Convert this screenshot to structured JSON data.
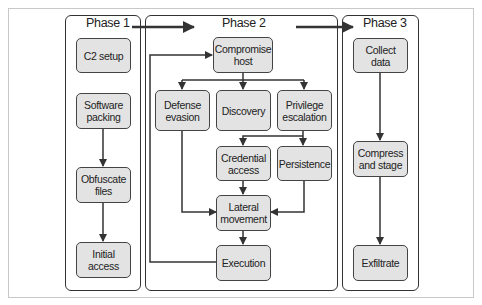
{
  "colors": {
    "node_fill": "#e3e3e3",
    "node_border": "#444444",
    "line": "#333333",
    "frame": "#c8c8c8"
  },
  "phases": [
    {
      "title": "Phase 1",
      "nodes": [
        "C2 setup",
        "Software\npacking",
        "Obfuscate\nfiles",
        "Initial\naccess"
      ]
    },
    {
      "title": "Phase 2",
      "nodes": [
        "Compromise\nhost",
        "Defense\nevasion",
        "Discovery",
        "Privilege\nescalation",
        "Credential\naccess",
        "Persistence",
        "Lateral\nmovement",
        "Execution"
      ]
    },
    {
      "title": "Phase 3",
      "nodes": [
        "Collect\ndata",
        "Compress\nand stage",
        "Exfiltrate"
      ]
    }
  ],
  "edges": [
    [
      "Software packing",
      "Obfuscate files"
    ],
    [
      "Obfuscate files",
      "Initial access"
    ],
    [
      "Phase 1",
      "Phase 2"
    ],
    [
      "Phase 2",
      "Phase 3"
    ],
    [
      "Compromise host",
      "Defense evasion"
    ],
    [
      "Compromise host",
      "Discovery"
    ],
    [
      "Compromise host",
      "Privilege escalation"
    ],
    [
      "Privilege escalation",
      "Credential access"
    ],
    [
      "Privilege escalation",
      "Persistence"
    ],
    [
      "Defense evasion",
      "Lateral movement"
    ],
    [
      "Credential access",
      "Lateral movement"
    ],
    [
      "Persistence",
      "Lateral movement"
    ],
    [
      "Lateral movement",
      "Execution"
    ],
    [
      "Execution",
      "Compromise host"
    ],
    [
      "Collect data",
      "Compress and stage"
    ],
    [
      "Compress and stage",
      "Exfiltrate"
    ]
  ]
}
